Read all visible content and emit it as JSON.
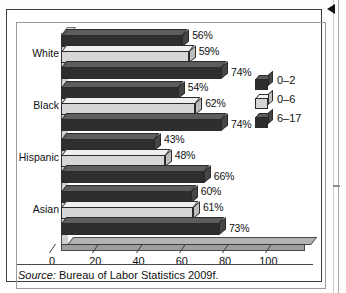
{
  "figure": {
    "source_prefix": "Source:",
    "source_text": " Bureau of Labor Statistics 2009f.",
    "corner_marker": "left-triangle-marker"
  },
  "chart_data": {
    "type": "bar",
    "orientation": "horizontal",
    "style": "3d",
    "title": "",
    "xlabel": "",
    "ylabel": "",
    "xlim": [
      0,
      110
    ],
    "xticks": [
      0,
      20,
      40,
      60,
      80,
      100
    ],
    "xticklabels": [
      "0",
      "20",
      "40",
      "60",
      "80",
      "100"
    ],
    "grid": false,
    "legend_position": "right",
    "categories": [
      "White",
      "Black",
      "Hispanic",
      "Asian"
    ],
    "series": [
      {
        "name": "0–2",
        "color": "#2e2e2e",
        "values": [
          56,
          54,
          43,
          60
        ],
        "labels": [
          "56%",
          "54%",
          "43%",
          "60%"
        ]
      },
      {
        "name": "0–6",
        "color": "#d6d6d6",
        "values": [
          59,
          62,
          48,
          61
        ],
        "labels": [
          "59%",
          "62%",
          "48%",
          "61%"
        ]
      },
      {
        "name": "6–17",
        "color": "#2e2e2e",
        "values": [
          74,
          74,
          66,
          73
        ],
        "labels": [
          "74%",
          "74%",
          "66%",
          "73%"
        ]
      }
    ]
  }
}
